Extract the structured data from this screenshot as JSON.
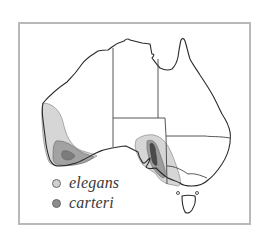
{
  "map": {
    "subject": "Australia distribution map",
    "colors": {
      "frame": "#b9b9b9",
      "coastline": "#2a2a2a",
      "state_border": "#444444",
      "elegans_fill": "#d6d6d6",
      "carteri_fill": "#9a9a9a",
      "core_fill": "#4a4a4a"
    }
  },
  "legend": {
    "items": [
      {
        "label": "elegans",
        "color": "#d0d0d0"
      },
      {
        "label": "carteri",
        "color": "#8c8c8c"
      }
    ]
  }
}
